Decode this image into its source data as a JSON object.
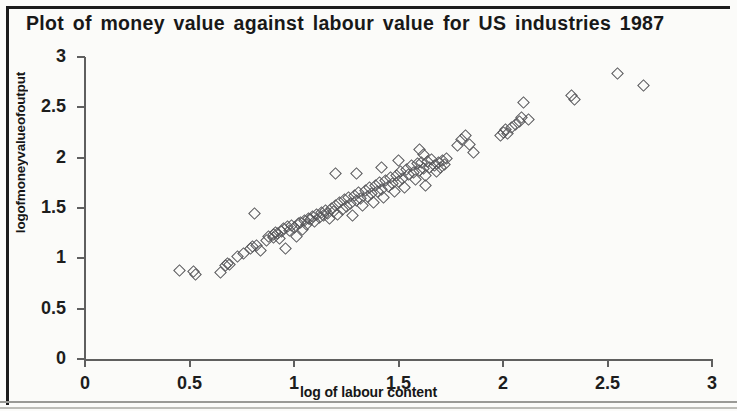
{
  "chart_data": {
    "type": "scatter",
    "title": "Plot of money value against labour value for US industries  1987",
    "xlabel": "log of labour content",
    "ylabel": "logofmoneyvalueofoutput",
    "xlim": [
      0,
      3
    ],
    "ylim": [
      0,
      3
    ],
    "xticks": [
      "0",
      "0.5",
      "1",
      "1.5",
      "2",
      "2.5",
      "3"
    ],
    "xtick_values": [
      0,
      0.5,
      1,
      1.5,
      2,
      2.5,
      3
    ],
    "yticks": [
      "0",
      "0.5",
      "1",
      "1.5",
      "2",
      "2.5",
      "3"
    ],
    "ytick_values": [
      0,
      0.5,
      1,
      1.5,
      2,
      2.5,
      3
    ],
    "grid": false,
    "legend": null,
    "marker": "open-diamond",
    "marker_color": "#555558",
    "points": [
      [
        0.45,
        0.88
      ],
      [
        0.52,
        0.87
      ],
      [
        0.53,
        0.84
      ],
      [
        0.65,
        0.86
      ],
      [
        0.67,
        0.93
      ],
      [
        0.68,
        0.95
      ],
      [
        0.69,
        0.94
      ],
      [
        0.73,
        1.02
      ],
      [
        0.76,
        1.05
      ],
      [
        0.79,
        1.1
      ],
      [
        0.8,
        1.12
      ],
      [
        0.81,
        1.45
      ],
      [
        0.82,
        1.13
      ],
      [
        0.84,
        1.08
      ],
      [
        0.87,
        1.18
      ],
      [
        0.88,
        1.22
      ],
      [
        0.9,
        1.21
      ],
      [
        0.9,
        1.24
      ],
      [
        0.91,
        1.26
      ],
      [
        0.92,
        1.25
      ],
      [
        0.93,
        1.2
      ],
      [
        0.94,
        1.27
      ],
      [
        0.95,
        1.3
      ],
      [
        0.96,
        1.1
      ],
      [
        0.97,
        1.32
      ],
      [
        0.98,
        1.28
      ],
      [
        0.99,
        1.33
      ],
      [
        1.0,
        1.31
      ],
      [
        1.01,
        1.22
      ],
      [
        1.02,
        1.35
      ],
      [
        1.03,
        1.36
      ],
      [
        1.04,
        1.29
      ],
      [
        1.05,
        1.38
      ],
      [
        1.06,
        1.34
      ],
      [
        1.07,
        1.4
      ],
      [
        1.08,
        1.39
      ],
      [
        1.09,
        1.42
      ],
      [
        1.1,
        1.37
      ],
      [
        1.11,
        1.44
      ],
      [
        1.12,
        1.41
      ],
      [
        1.13,
        1.46
      ],
      [
        1.14,
        1.43
      ],
      [
        1.15,
        1.48
      ],
      [
        1.16,
        1.45
      ],
      [
        1.17,
        1.4
      ],
      [
        1.18,
        1.5
      ],
      [
        1.19,
        1.47
      ],
      [
        1.2,
        1.52
      ],
      [
        1.21,
        1.44
      ],
      [
        1.22,
        1.55
      ],
      [
        1.2,
        1.84
      ],
      [
        1.23,
        1.49
      ],
      [
        1.24,
        1.58
      ],
      [
        1.25,
        1.51
      ],
      [
        1.26,
        1.6
      ],
      [
        1.27,
        1.54
      ],
      [
        1.28,
        1.43
      ],
      [
        1.29,
        1.62
      ],
      [
        1.3,
        1.57
      ],
      [
        1.31,
        1.65
      ],
      [
        1.32,
        1.59
      ],
      [
        1.33,
        1.52
      ],
      [
        1.34,
        1.67
      ],
      [
        1.35,
        1.61
      ],
      [
        1.36,
        1.7
      ],
      [
        1.3,
        1.84
      ],
      [
        1.37,
        1.64
      ],
      [
        1.38,
        1.55
      ],
      [
        1.39,
        1.72
      ],
      [
        1.4,
        1.66
      ],
      [
        1.41,
        1.75
      ],
      [
        1.42,
        1.68
      ],
      [
        1.43,
        1.6
      ],
      [
        1.44,
        1.77
      ],
      [
        1.45,
        1.71
      ],
      [
        1.46,
        1.8
      ],
      [
        1.47,
        1.74
      ],
      [
        1.42,
        1.9
      ],
      [
        1.48,
        1.66
      ],
      [
        1.49,
        1.82
      ],
      [
        1.5,
        1.76
      ],
      [
        1.51,
        1.86
      ],
      [
        1.52,
        1.79
      ],
      [
        1.53,
        1.7
      ],
      [
        1.54,
        1.88
      ],
      [
        1.55,
        1.83
      ],
      [
        1.56,
        1.92
      ],
      [
        1.57,
        1.85
      ],
      [
        1.58,
        1.78
      ],
      [
        1.59,
        1.94
      ],
      [
        1.5,
        1.97
      ],
      [
        1.6,
        1.87
      ],
      [
        1.61,
        1.95
      ],
      [
        1.62,
        1.89
      ],
      [
        1.63,
        1.82
      ],
      [
        1.64,
        1.96
      ],
      [
        1.65,
        1.9
      ],
      [
        1.66,
        1.98
      ],
      [
        1.67,
        1.92
      ],
      [
        1.68,
        1.86
      ],
      [
        1.69,
        1.95
      ],
      [
        1.7,
        1.9
      ],
      [
        1.71,
        1.97
      ],
      [
        1.72,
        1.93
      ],
      [
        1.63,
        1.72
      ],
      [
        1.73,
        1.99
      ],
      [
        1.78,
        2.12
      ],
      [
        1.8,
        2.18
      ],
      [
        1.82,
        2.22
      ],
      [
        1.84,
        2.13
      ],
      [
        1.86,
        2.05
      ],
      [
        1.62,
        2.03
      ],
      [
        1.6,
        2.08
      ],
      [
        1.99,
        2.22
      ],
      [
        2.0,
        2.25
      ],
      [
        2.01,
        2.28
      ],
      [
        2.02,
        2.24
      ],
      [
        2.04,
        2.3
      ],
      [
        2.06,
        2.33
      ],
      [
        2.08,
        2.36
      ],
      [
        2.09,
        2.4
      ],
      [
        2.1,
        2.55
      ],
      [
        2.12,
        2.38
      ],
      [
        2.33,
        2.62
      ],
      [
        2.34,
        2.58
      ],
      [
        2.55,
        2.84
      ],
      [
        2.67,
        2.72
      ]
    ]
  }
}
